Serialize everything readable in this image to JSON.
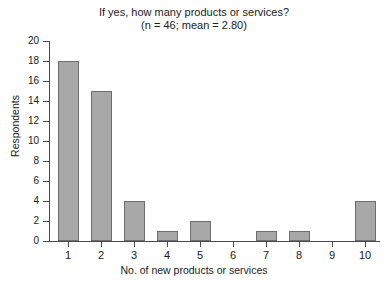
{
  "chart_data": {
    "type": "bar",
    "title": "If yes, how many products or services?",
    "subtitle": "(n = 46; mean = 2.80)",
    "xlabel": "No. of new products or services",
    "ylabel": "Respondents",
    "categories": [
      "1",
      "2",
      "3",
      "4",
      "5",
      "6",
      "7",
      "8",
      "9",
      "10"
    ],
    "values": [
      18,
      15,
      4,
      1,
      2,
      0,
      1,
      1,
      0,
      4
    ],
    "ylim": [
      0,
      20
    ],
    "ytick_step": 2,
    "ytick_labels": [
      "0",
      "2",
      "4",
      "6",
      "8",
      "10",
      "12",
      "14",
      "16",
      "18",
      "20"
    ],
    "grid": false,
    "legend": null,
    "n": 46,
    "mean": 2.8,
    "bar_color": "#a8a8a8",
    "bar_edge_color": "#6e6e6e",
    "axis_color": "#4a4a4a",
    "text_color": "#1a1a1a",
    "background_color": "#ffffff"
  }
}
